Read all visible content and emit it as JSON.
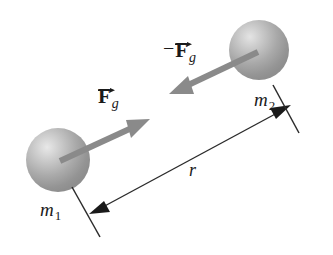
{
  "figure": {
    "background_color": "#ffffff",
    "width": 333,
    "height": 255
  },
  "labels": {
    "force_left": {
      "symbol": "F",
      "subscript": "g",
      "sign": "",
      "full": "F_g",
      "description": "gravitational force on mass 1"
    },
    "force_right": {
      "symbol": "F",
      "subscript": "g",
      "sign": "−",
      "full": "-F_g",
      "description": "reaction gravitational force on mass 2"
    },
    "mass_left": {
      "symbol": "m",
      "subscript": "1",
      "full": "m1"
    },
    "mass_right": {
      "symbol": "m",
      "subscript": "2",
      "full": "m2"
    },
    "separation": {
      "symbol": "r",
      "full": "r",
      "description": "center-to-center separation distance"
    }
  },
  "bodies": [
    {
      "name": "sphere-mass-1",
      "cx": 58,
      "cy": 160,
      "r": 32,
      "fill": "#a8a8a8",
      "highlight": "#e0e0e0"
    },
    {
      "name": "sphere-mass-2",
      "cx": 259,
      "cy": 50,
      "r": 30,
      "fill": "#a8a8a8",
      "highlight": "#e0e0e0"
    }
  ],
  "vectors": [
    {
      "name": "force-arrow-left",
      "x1": 60,
      "y1": 161,
      "x2": 146,
      "y2": 121,
      "color": "#8a8a8a",
      "direction": "up-right"
    },
    {
      "name": "force-arrow-right",
      "x1": 258,
      "y1": 52,
      "x2": 173,
      "y2": 92,
      "color": "#8a8a8a",
      "direction": "down-left"
    }
  ],
  "dimension": {
    "name": "separation-dimension-line",
    "color": "#1a1a1a",
    "x1": 91,
    "y1": 213,
    "x2": 289,
    "y2": 106,
    "tick_left": {
      "x1": 72,
      "y1": 188,
      "x2": 99,
      "y2": 236
    },
    "tick_right": {
      "x1": 272,
      "y1": 86,
      "x2": 298,
      "y2": 133
    }
  },
  "colors": {
    "ink": "#1a1a1a",
    "arrow_gray": "#8a8a8a",
    "sphere_gray": "#a8a8a8",
    "background": "#ffffff"
  }
}
